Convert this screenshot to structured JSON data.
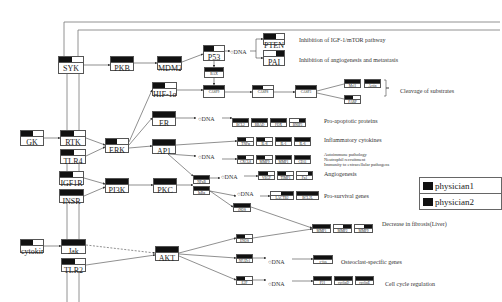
{
  "diagram": {
    "receptors": [
      {
        "id": "syk",
        "label": "SYK",
        "x": 58,
        "y": 56,
        "w": 26,
        "h": 18,
        "fill": 0.55
      },
      {
        "id": "rtk",
        "label": "RTK",
        "x": 60,
        "y": 130,
        "w": 26,
        "h": 16,
        "fill": 0.55
      },
      {
        "id": "tlr4",
        "label": "TLR4",
        "x": 60,
        "y": 149,
        "w": 26,
        "h": 15,
        "fill": 0.55
      },
      {
        "id": "gk",
        "label": "GK",
        "x": 20,
        "y": 130,
        "w": 24,
        "h": 16,
        "fill": 0.55
      },
      {
        "id": "igf1r",
        "label": "IGF1R",
        "x": 59,
        "y": 171,
        "w": 25,
        "h": 14,
        "fill": 0.55
      },
      {
        "id": "insr",
        "label": "INSR",
        "x": 59,
        "y": 189,
        "w": 25,
        "h": 14,
        "fill": 1.0
      },
      {
        "id": "jak",
        "label": "Jak",
        "x": 61,
        "y": 239,
        "w": 25,
        "h": 15,
        "fill": 1.0
      },
      {
        "id": "tlr2",
        "label": "TLR2",
        "x": 61,
        "y": 258,
        "w": 25,
        "h": 14,
        "fill": 0.55
      },
      {
        "id": "cytokine",
        "label": "cytokine",
        "x": 20,
        "y": 239,
        "w": 24,
        "h": 14,
        "fill": 0.55
      }
    ],
    "kinases": [
      {
        "id": "pkb",
        "label": "PKB",
        "x": 110,
        "y": 56,
        "w": 24,
        "h": 15,
        "fill": 1.0
      },
      {
        "id": "erk",
        "label": "ERK",
        "x": 105,
        "y": 138,
        "w": 24,
        "h": 15,
        "fill": 0.5
      },
      {
        "id": "pi3k",
        "label": "PI3K",
        "x": 105,
        "y": 178,
        "w": 24,
        "h": 15,
        "fill": 1.0
      },
      {
        "id": "pkc",
        "label": "PKC",
        "x": 153,
        "y": 178,
        "w": 24,
        "h": 15,
        "fill": 1.0
      },
      {
        "id": "akt",
        "label": "AKT",
        "x": 155,
        "y": 246,
        "w": 24,
        "h": 15,
        "fill": 1.0
      },
      {
        "id": "mdm2",
        "label": "MDM2",
        "x": 157,
        "y": 56,
        "w": 25,
        "h": 14,
        "fill": 1.0
      },
      {
        "id": "p53",
        "label": "P53",
        "x": 203,
        "y": 45,
        "w": 22,
        "h": 16,
        "fill": 0.5
      },
      {
        "id": "hif1a",
        "label": "HIF-1α",
        "x": 152,
        "y": 82,
        "w": 25,
        "h": 14,
        "fill": 0.5
      },
      {
        "id": "er",
        "label": "ER",
        "x": 152,
        "y": 111,
        "w": 24,
        "h": 15,
        "fill": 1.0
      },
      {
        "id": "ap1",
        "label": "AP1",
        "x": 152,
        "y": 139,
        "w": 24,
        "h": 15,
        "fill": 1.0
      },
      {
        "id": "bax",
        "label": "BAX",
        "x": 204,
        "y": 67,
        "w": 20,
        "h": 11,
        "fill": 1.0
      },
      {
        "id": "casp9",
        "label": "CASP9",
        "x": 203,
        "y": 85,
        "w": 22,
        "h": 13,
        "fill": 1.0
      },
      {
        "id": "casp8",
        "label": "CASP8",
        "x": 252,
        "y": 85,
        "w": 22,
        "h": 13,
        "fill": 0.5
      },
      {
        "id": "casp3",
        "label": "CASP3",
        "x": 295,
        "y": 85,
        "w": 22,
        "h": 13,
        "fill": 1.0
      },
      {
        "id": "nfkb",
        "label": "NFκB",
        "x": 193,
        "y": 175,
        "w": 17,
        "h": 9,
        "fill": 1.0
      },
      {
        "id": "ikba",
        "label": "IκBα",
        "x": 193,
        "y": 186,
        "w": 17,
        "h": 9,
        "fill": 1.0
      },
      {
        "id": "inos",
        "label": "iNOS",
        "x": 233,
        "y": 203,
        "w": 18,
        "h": 9,
        "fill": 1.0
      },
      {
        "id": "enos",
        "label": "ENOS",
        "x": 236,
        "y": 234,
        "w": 17,
        "h": 9,
        "fill": 0.5
      },
      {
        "id": "nfatc1",
        "label": "NFATc1",
        "x": 236,
        "y": 254,
        "w": 17,
        "h": 9,
        "fill": 1.0
      },
      {
        "id": "e2f",
        "label": "E2F",
        "x": 236,
        "y": 276,
        "w": 17,
        "h": 9,
        "fill": 0.5
      }
    ],
    "outputs": [
      {
        "id": "pten",
        "label": "PTEN",
        "x": 263,
        "y": 33,
        "w": 22,
        "h": 12,
        "fill": 0.6
      },
      {
        "id": "pai",
        "label": "PAI",
        "x": 263,
        "y": 50,
        "w": 22,
        "h": 16,
        "fill": 0.4,
        "right": true
      },
      {
        "id": "mcl1",
        "label": "Mcl1",
        "x": 344,
        "y": 79,
        "w": 17,
        "h": 9,
        "fill": 1.0
      },
      {
        "id": "actin",
        "label": "Actin",
        "x": 364,
        "y": 79,
        "w": 17,
        "h": 9,
        "fill": 1.0
      },
      {
        "id": "parp",
        "label": "PARP",
        "x": 344,
        "y": 95,
        "w": 17,
        "h": 9,
        "fill": 0.5
      },
      {
        "id": "bcl2",
        "label": "BCL2",
        "x": 232,
        "y": 118,
        "w": 17,
        "h": 9,
        "fill": 1.0
      },
      {
        "id": "bbad",
        "label": "BBAD",
        "x": 251,
        "y": 118,
        "w": 17,
        "h": 9,
        "fill": 1.0
      },
      {
        "id": "fox",
        "label": "FOX",
        "x": 270,
        "y": 118,
        "w": 17,
        "h": 9,
        "fill": 1.0
      },
      {
        "id": "bnip3",
        "label": "BNIP3",
        "x": 289,
        "y": 118,
        "w": 17,
        "h": 9,
        "fill": 0.4,
        "right": true
      },
      {
        "id": "tnfa",
        "label": "TNFα",
        "x": 237,
        "y": 137,
        "w": 17,
        "h": 9,
        "fill": 0.5
      },
      {
        "id": "il8",
        "label": "IL-8",
        "x": 256,
        "y": 137,
        "w": 17,
        "h": 9,
        "fill": 0.5
      },
      {
        "id": "il1",
        "label": "IL-1",
        "x": 275,
        "y": 137,
        "w": 17,
        "h": 9,
        "fill": 1.0
      },
      {
        "id": "il6",
        "label": "IL-6",
        "x": 294,
        "y": 137,
        "w": 17,
        "h": 9,
        "fill": 1.0
      },
      {
        "id": "cxcl8",
        "label": "CXCL8",
        "x": 237,
        "y": 155,
        "w": 17,
        "h": 9,
        "fill": 0.5
      },
      {
        "id": "mmp9",
        "label": "MMP9",
        "x": 256,
        "y": 155,
        "w": 17,
        "h": 9,
        "fill": 0.5
      },
      {
        "id": "mmp1",
        "label": "MMP1",
        "x": 275,
        "y": 155,
        "w": 17,
        "h": 9,
        "fill": 1.0
      },
      {
        "id": "cd11",
        "label": "CD11",
        "x": 294,
        "y": 155,
        "w": 17,
        "h": 9,
        "fill": 1.0
      },
      {
        "id": "vegf",
        "label": "VEGF",
        "x": 258,
        "y": 171,
        "w": 17,
        "h": 9,
        "fill": 0.6
      },
      {
        "id": "timp1",
        "label": "TIMP1",
        "x": 277,
        "y": 171,
        "w": 17,
        "h": 9,
        "fill": 0.5
      },
      {
        "id": "fn1",
        "label": "Fn1",
        "x": 296,
        "y": 171,
        "w": 17,
        "h": 9,
        "fill": 0.3,
        "right": true
      },
      {
        "id": "lakt",
        "label": "LACTB2",
        "x": 270,
        "y": 191,
        "w": 24,
        "h": 9,
        "fill": 0.55,
        "right": true
      },
      {
        "id": "bcl2l",
        "label": "BCL2L",
        "x": 296,
        "y": 191,
        "w": 23,
        "h": 9,
        "fill": 1.0
      },
      {
        "id": "mmp1b",
        "label": "MMP1",
        "x": 312,
        "y": 224,
        "w": 19,
        "h": 9,
        "fill": 1.0
      },
      {
        "id": "mmp2",
        "label": "MMP2",
        "x": 333,
        "y": 224,
        "w": 19,
        "h": 9,
        "fill": 0.5,
        "right": true
      },
      {
        "id": "mmp9b",
        "label": "MMP9",
        "x": 354,
        "y": 224,
        "w": 19,
        "h": 9,
        "fill": 0.5,
        "right": true
      },
      {
        "id": "cfos",
        "label": "c-fos",
        "x": 313,
        "y": 255,
        "w": 20,
        "h": 9,
        "fill": 1.0
      },
      {
        "id": "p21",
        "label": "P21",
        "x": 313,
        "y": 276,
        "w": 19,
        "h": 9,
        "fill": 1.0
      },
      {
        "id": "cyclind",
        "label": "cyclinD",
        "x": 334,
        "y": 276,
        "w": 19,
        "h": 9,
        "fill": 1.0
      },
      {
        "id": "cycline",
        "label": "cyclinE",
        "x": 355,
        "y": 276,
        "w": 19,
        "h": 9,
        "fill": 1.0
      }
    ],
    "dna_labels": [
      {
        "id": "dna-p53",
        "text": "○DNA",
        "x": 230,
        "y": 49
      },
      {
        "id": "dna-er",
        "text": "○DNA",
        "x": 198,
        "y": 116
      },
      {
        "id": "dna-ap1",
        "text": "○DNA",
        "x": 198,
        "y": 154
      },
      {
        "id": "dna-nfkb",
        "text": "○DNA",
        "x": 221,
        "y": 174
      },
      {
        "id": "dna-ikba",
        "text": "○DNA",
        "x": 237,
        "y": 191
      },
      {
        "id": "dna-nfatc1",
        "text": "○DNA",
        "x": 268,
        "y": 259
      },
      {
        "id": "dna-e2f",
        "text": "○DNA",
        "x": 268,
        "y": 281
      }
    ],
    "annotations": [
      {
        "id": "ann-igf",
        "text": "Inhibition of IGF-1/mTOR pathway",
        "x": 299,
        "y": 37
      },
      {
        "id": "ann-angio",
        "text": "Inhibition of angiogenesis and metastasis",
        "x": 299,
        "y": 57
      },
      {
        "id": "ann-cleavage",
        "text": "Cleavage of substrates",
        "x": 400,
        "y": 88
      },
      {
        "id": "ann-proapop",
        "text": "Pro-apoptotic proteins",
        "x": 324,
        "y": 118
      },
      {
        "id": "ann-inflam",
        "text": "Inflammatory cytokines",
        "x": 324,
        "y": 137
      },
      {
        "id": "ann-autoimm",
        "text": "Autoimmune pathology",
        "x": 324,
        "y": 152,
        "small": true
      },
      {
        "id": "ann-neutro",
        "text": "Neutrophil recruitment",
        "x": 324,
        "y": 157,
        "small": true
      },
      {
        "id": "ann-immunity",
        "text": "Immunity to extracellular pathogens",
        "x": 324,
        "y": 162,
        "small": true
      },
      {
        "id": "ann-angiogenesis",
        "text": "Angiogenesis",
        "x": 324,
        "y": 171
      },
      {
        "id": "ann-prosurv",
        "text": "Pro-survival genes",
        "x": 324,
        "y": 193
      },
      {
        "id": "ann-fibrosis",
        "text": "Decrease in fibrosis(Liver)",
        "x": 382,
        "y": 221
      },
      {
        "id": "ann-osteo",
        "text": "Osteoclast-specific genes",
        "x": 341,
        "y": 259
      },
      {
        "id": "ann-cellcycle",
        "text": "Cell cycle regulation",
        "x": 385,
        "y": 281
      }
    ]
  },
  "legend": {
    "items": [
      {
        "label": "physician1",
        "color": "#111111"
      },
      {
        "label": "physician2",
        "color": "#111111"
      }
    ]
  }
}
